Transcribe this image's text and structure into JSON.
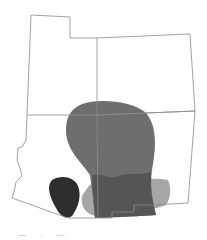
{
  "map": {
    "title": "Four Corners states range map",
    "regions": [
      {
        "name": "Utah",
        "id": "utah"
      },
      {
        "name": "Colorado",
        "id": "colorado"
      },
      {
        "name": "Arizona",
        "id": "arizona"
      },
      {
        "name": "New Mexico",
        "id": "new-mexico"
      }
    ],
    "overlays": [
      {
        "id": "range-medium",
        "color": "#6e6e6e"
      },
      {
        "id": "range-light",
        "color": "#a6a6a6"
      },
      {
        "id": "range-overlap",
        "color": "#555555"
      },
      {
        "id": "range-dark",
        "color": "#2e2e2e"
      }
    ],
    "border_color": "#8a8a8a"
  },
  "caption": {
    "text": "— . —"
  }
}
